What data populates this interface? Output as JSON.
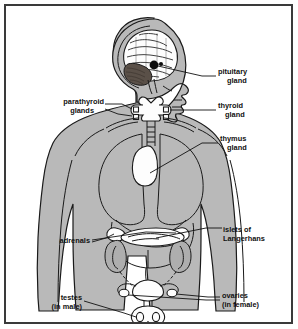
{
  "figure": {
    "border_color": "#3a3a3a",
    "body_fill_color": "#b9b9b9",
    "outline_color": "#1a1a1a",
    "background_color": "#ffffff"
  },
  "labels": {
    "pituitary": {
      "line1": "pituitary",
      "line2": "gland",
      "side": "right"
    },
    "thyroid": {
      "line1": "thyroid",
      "line2": "gland",
      "side": "right"
    },
    "parathyroid": {
      "line1": "parathyroid",
      "line2": "glands",
      "side": "left"
    },
    "thymus": {
      "line1": "thymus",
      "line2": "gland",
      "side": "right"
    },
    "islets": {
      "line1": "islets of",
      "line2": "Langerhans",
      "side": "right"
    },
    "adrenals": {
      "line1": "adrenals",
      "line2": "",
      "side": "left"
    },
    "ovaries": {
      "line1": "ovaries",
      "line2": "(in female)",
      "side": "right"
    },
    "testes": {
      "line1": "testes",
      "line2": "(in male)",
      "side": "left"
    }
  },
  "organs": {
    "brain": "brain",
    "cerebellum": "cerebellum",
    "pituitary_gland": "pituitary gland",
    "thyroid_gland": "thyroid gland",
    "parathyroid_glands": "parathyroid glands",
    "thymus_gland": "thymus gland",
    "lungs": "lungs",
    "liver": "liver",
    "pancreas_islets": "islets of Langerhans",
    "kidneys": "kidneys",
    "adrenal_glands": "adrenal glands",
    "uterus": "uterus",
    "ovaries": "ovaries",
    "scrotum_testes": "testes"
  }
}
